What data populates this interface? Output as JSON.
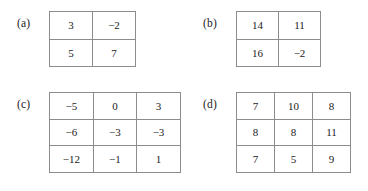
{
  "figure": {
    "background_color": "#ffffff",
    "grid_line_color": "#8c8c8c",
    "text_color": "#1a1a1a"
  },
  "blocks": [
    {
      "id": "a",
      "label": "(a)",
      "rows": 2,
      "cols": 2,
      "cells": [
        [
          "3",
          "−2"
        ],
        [
          "5",
          "7"
        ]
      ]
    },
    {
      "id": "b",
      "label": "(b)",
      "rows": 2,
      "cols": 2,
      "cells": [
        [
          "14",
          "11"
        ],
        [
          "16",
          "−2"
        ]
      ]
    },
    {
      "id": "c",
      "label": "(c)",
      "rows": 3,
      "cols": 3,
      "cells": [
        [
          "−5",
          "0",
          "3"
        ],
        [
          "−6",
          "−3",
          "−3"
        ],
        [
          "−12",
          "−1",
          "1"
        ]
      ]
    },
    {
      "id": "d",
      "label": "(d)",
      "rows": 3,
      "cols": 3,
      "cells": [
        [
          "7",
          "10",
          "8"
        ],
        [
          "8",
          "8",
          "11"
        ],
        [
          "7",
          "5",
          "9"
        ]
      ]
    }
  ]
}
